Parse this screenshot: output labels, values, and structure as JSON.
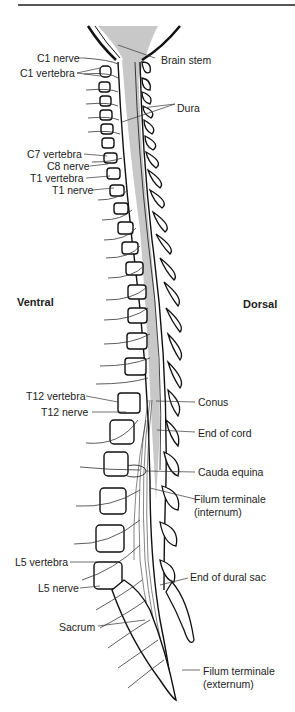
{
  "figure": {
    "orientation": {
      "ventral": "Ventral",
      "dorsal": "Dorsal"
    },
    "left_labels": {
      "c1_nerve": "C1 nerve",
      "c1_vertebra": "C1 vertebra",
      "c7_vertebra": "C7 vertebra",
      "c8_nerve": "C8 nerve",
      "t1_vertebra": "T1 vertebra",
      "t1_nerve": "T1 nerve",
      "t12_vertebra": "T12 vertebra",
      "t12_nerve": "T12 nerve",
      "l5_vertebra": "L5 vertebra",
      "l5_nerve": "L5 nerve",
      "sacrum": "Sacrum"
    },
    "right_labels": {
      "brain_stem": "Brain stem",
      "dura": "Dura",
      "conus": "Conus",
      "end_of_cord": "End of cord",
      "cauda_equina": "Cauda equina",
      "filum_internum_1": "Filum terminale",
      "filum_internum_2": "(internum)",
      "end_of_dural_sac": "End of dural sac",
      "filum_externum_1": "Filum terminale",
      "filum_externum_2": "(externum)"
    },
    "colors": {
      "cord_fill": "#c8c8c8",
      "line": "#111111",
      "text": "#222222"
    }
  }
}
